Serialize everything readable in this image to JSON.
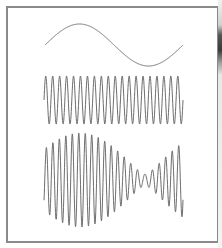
{
  "figure": {
    "title": "",
    "colors": {
      "background": "#ffffff",
      "frame_border": "#8a8a8a",
      "wave_stroke": "#6e6e6e"
    },
    "panels": [
      {
        "name": "low-frequency-sine",
        "description": "Single slow sine wave (about one full cycle)",
        "x_start": 45,
        "x_end": 183,
        "midline_y": 45,
        "amplitude": 21,
        "cycles": 1.0,
        "phase": 0,
        "modulation": "none"
      },
      {
        "name": "high-frequency-carrier",
        "description": "Constant-amplitude high-frequency sine wave (about 20 cycles)",
        "x_start": 44,
        "x_end": 183,
        "midline_y": 100,
        "amplitude": 24,
        "cycles": 20.0,
        "phase": 0,
        "modulation": "none"
      },
      {
        "name": "beat-modulated-signal",
        "description": "Amplitude-varying signal (beats): large envelope on left, near-zero around x≈145, rising again on right",
        "x_start": 44,
        "x_end": 183,
        "midline_y": 180,
        "cycles": 21.0,
        "phase": 0,
        "modulation": "beat",
        "component_a": 26.5,
        "component_b": 20.5,
        "beat_period_px": 130,
        "envelope_peak_x": 80
      }
    ]
  }
}
